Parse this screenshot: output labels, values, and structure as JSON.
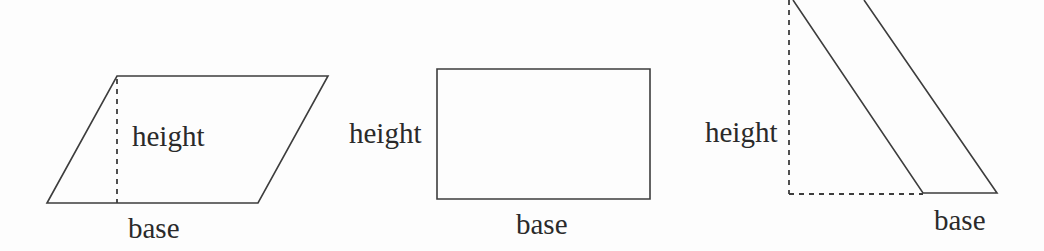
{
  "diagram": {
    "colors": {
      "line": "#3d3d3d",
      "text": "#2a2a2a",
      "background": "#fdfdfd"
    },
    "shapes": [
      {
        "name": "parallelogram",
        "height_label": "height",
        "base_label": "base",
        "outline_path": "M47,203 L117,76 L328,76 L258,203 Z",
        "height_line_path": "M117,79 L117,203"
      },
      {
        "name": "rectangle",
        "height_label": "height",
        "base_label": "base",
        "outline_path": "M437,69 L650,69 L650,199 L437,199 Z"
      },
      {
        "name": "slanted-parallelogram",
        "height_label": "height",
        "base_label": "base",
        "outline_path": "M793,0 L923,193 L997,193 L864,0",
        "height_line_path": "M789,0 L789,194",
        "base_line_path": "M789,194 L923,194"
      }
    ]
  }
}
